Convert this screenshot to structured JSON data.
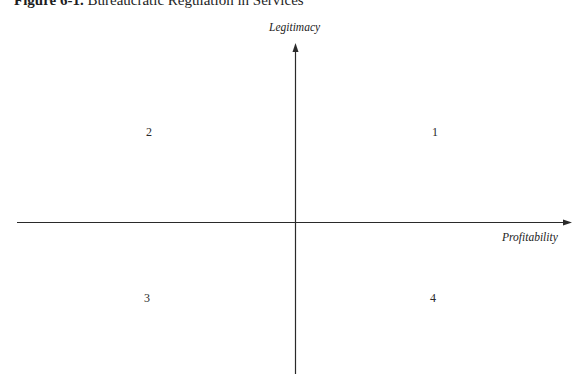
{
  "figure": {
    "number_label": "Figure 6-1.",
    "title_text": " Bureaucratic Regulation in Services"
  },
  "axes": {
    "y_label": "Legitimacy",
    "x_label": "Profitability",
    "line_color": "#2a2a2a"
  },
  "quadrants": [
    {
      "id": "q1",
      "label": "1",
      "position": "upper-right"
    },
    {
      "id": "q2",
      "label": "2",
      "position": "upper-left"
    },
    {
      "id": "q3",
      "label": "3",
      "position": "lower-left"
    },
    {
      "id": "q4",
      "label": "4",
      "position": "lower-right"
    }
  ]
}
